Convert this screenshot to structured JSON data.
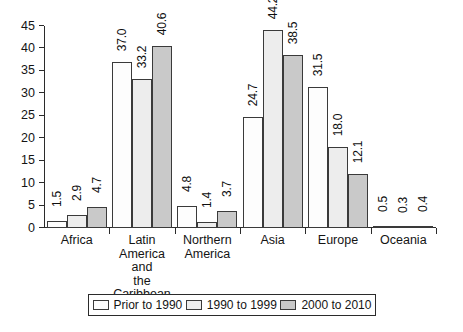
{
  "chart_data": {
    "type": "bar",
    "title": "",
    "subtitle": "",
    "xlabel": "",
    "ylabel": "",
    "ylim": [
      0,
      45
    ],
    "yticks": [
      0,
      5,
      10,
      15,
      20,
      25,
      30,
      35,
      40,
      45
    ],
    "grid": false,
    "legend_position": "bottom",
    "categories": [
      "Africa",
      "Latin America and the Caribbean",
      "Northern America",
      "Asia",
      "Europe",
      "Oceania"
    ],
    "category_lines": [
      [
        "Africa"
      ],
      [
        "Latin",
        "America and",
        "the Caribbean"
      ],
      [
        "Northern",
        "America"
      ],
      [
        "Asia"
      ],
      [
        "Europe"
      ],
      [
        "Oceania"
      ]
    ],
    "series": [
      {
        "name": "Prior to 1990",
        "color": "#fdfdfd",
        "values": [
          1.5,
          37.0,
          4.8,
          24.7,
          31.5,
          0.5
        ],
        "labels": [
          "1.5",
          "37.0",
          "4.8",
          "24.7",
          "31.5",
          "0.5"
        ]
      },
      {
        "name": "1990 to 1999",
        "color": "#ededed",
        "values": [
          2.9,
          33.2,
          1.4,
          44.2,
          18.0,
          0.3
        ],
        "labels": [
          "2.9",
          "33.2",
          "1.4",
          "44.2",
          "18.0",
          "0.3"
        ]
      },
      {
        "name": "2000 to 2010",
        "color": "#c9c9c9",
        "values": [
          4.7,
          40.6,
          3.7,
          38.5,
          12.1,
          0.4
        ],
        "labels": [
          "4.7",
          "40.6",
          "3.7",
          "38.5",
          "12.1",
          "0.4"
        ]
      }
    ]
  },
  "legend": {
    "items": [
      {
        "label": "Prior to 1990"
      },
      {
        "label": "1990 to 1999"
      },
      {
        "label": "2000 to 2010"
      }
    ]
  },
  "caption": ""
}
